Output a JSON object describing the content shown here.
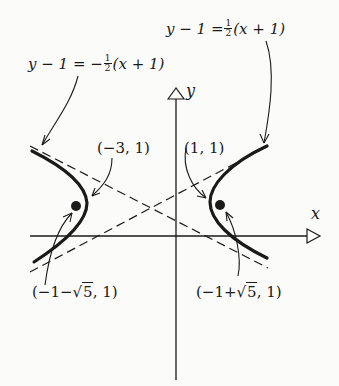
{
  "figure": {
    "type": "hyperbola-graph",
    "axes": {
      "x_label": "x",
      "y_label": "y"
    },
    "asymptotes": [
      {
        "id": "positive-slope",
        "lhs": "y − 1",
        "eq": "=",
        "sign": "",
        "frac_num": "1",
        "frac_den": "2",
        "rhs": "(x + 1)",
        "full": "y − 1 = ½(x + 1)"
      },
      {
        "id": "negative-slope",
        "lhs": "y − 1",
        "eq": "=",
        "sign": "−",
        "frac_num": "1",
        "frac_den": "2",
        "rhs": "(x + 1)",
        "full": "y − 1 = −½(x + 1)"
      }
    ],
    "vertices": [
      {
        "label": "(−3, 1)"
      },
      {
        "label": "(1, 1)"
      }
    ],
    "foci": [
      {
        "prefix": "(−1−",
        "radicand": "5",
        "suffix": ", 1)",
        "full": "(−1−√5, 1)"
      },
      {
        "prefix": "(−1+",
        "radicand": "5",
        "suffix": ", 1)",
        "full": "(−1+√5, 1)"
      }
    ],
    "center": "(−1, 1)",
    "colors": {
      "ink": "#1a1a1a",
      "paper": "#fbfbf9"
    }
  }
}
